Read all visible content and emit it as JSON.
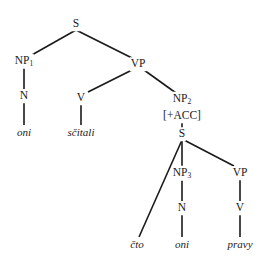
{
  "diagram": {
    "type": "syntax-tree",
    "nodes": [
      {
        "id": "s_root",
        "label": "S",
        "sub": "",
        "x": 76,
        "y": 24,
        "leaf": false
      },
      {
        "id": "np1",
        "label": "NP",
        "sub": "1",
        "x": 24,
        "y": 61,
        "leaf": false
      },
      {
        "id": "n1",
        "label": "N",
        "sub": "",
        "x": 24,
        "y": 96,
        "leaf": false
      },
      {
        "id": "oni1",
        "label": "oni",
        "sub": "",
        "x": 24,
        "y": 132,
        "leaf": true
      },
      {
        "id": "vp1",
        "label": "VP",
        "sub": "",
        "x": 138,
        "y": 64,
        "leaf": false
      },
      {
        "id": "v1",
        "label": "V",
        "sub": "",
        "x": 81,
        "y": 98,
        "leaf": false
      },
      {
        "id": "scitali",
        "label": "sčitali",
        "sub": "",
        "x": 81,
        "y": 132,
        "leaf": true
      },
      {
        "id": "np2",
        "label": "NP",
        "sub": "2",
        "x": 182,
        "y": 99,
        "leaf": false
      },
      {
        "id": "acc",
        "label": "[+ACC]",
        "sub": "",
        "x": 182,
        "y": 116,
        "leaf": false
      },
      {
        "id": "s_emb",
        "label": "S",
        "sub": "",
        "x": 182,
        "y": 134,
        "leaf": false
      },
      {
        "id": "cto",
        "label": "čto",
        "sub": "",
        "x": 137,
        "y": 244,
        "leaf": true
      },
      {
        "id": "np3",
        "label": "NP",
        "sub": "3",
        "x": 182,
        "y": 173,
        "leaf": false
      },
      {
        "id": "n3",
        "label": "N",
        "sub": "",
        "x": 182,
        "y": 208,
        "leaf": false
      },
      {
        "id": "oni2",
        "label": "oni",
        "sub": "",
        "x": 182,
        "y": 244,
        "leaf": true
      },
      {
        "id": "vp2",
        "label": "VP",
        "sub": "",
        "x": 240,
        "y": 173,
        "leaf": false
      },
      {
        "id": "v2",
        "label": "V",
        "sub": "",
        "x": 240,
        "y": 208,
        "leaf": false
      },
      {
        "id": "pravy",
        "label": "pravy",
        "sub": "",
        "x": 240,
        "y": 244,
        "leaf": true
      }
    ],
    "edges": [
      {
        "from": [
          76,
          30
        ],
        "to": [
          30,
          56
        ]
      },
      {
        "from": [
          76,
          30
        ],
        "to": [
          132,
          58
        ]
      },
      {
        "from": [
          24,
          68
        ],
        "to": [
          24,
          89
        ]
      },
      {
        "from": [
          24,
          103
        ],
        "to": [
          24,
          125
        ]
      },
      {
        "from": [
          132,
          70
        ],
        "to": [
          88,
          92
        ]
      },
      {
        "from": [
          144,
          70
        ],
        "to": [
          176,
          93
        ]
      },
      {
        "from": [
          81,
          105
        ],
        "to": [
          81,
          125
        ]
      },
      {
        "from": [
          182,
          122
        ],
        "to": [
          182,
          128
        ]
      },
      {
        "from": [
          182,
          140
        ],
        "to": [
          139,
          237
        ]
      },
      {
        "from": [
          182,
          140
        ],
        "to": [
          182,
          166
        ]
      },
      {
        "from": [
          184,
          140
        ],
        "to": [
          234,
          166
        ]
      },
      {
        "from": [
          182,
          180
        ],
        "to": [
          182,
          201
        ]
      },
      {
        "from": [
          182,
          215
        ],
        "to": [
          182,
          237
        ]
      },
      {
        "from": [
          240,
          180
        ],
        "to": [
          240,
          201
        ]
      },
      {
        "from": [
          240,
          215
        ],
        "to": [
          240,
          237
        ]
      }
    ]
  }
}
